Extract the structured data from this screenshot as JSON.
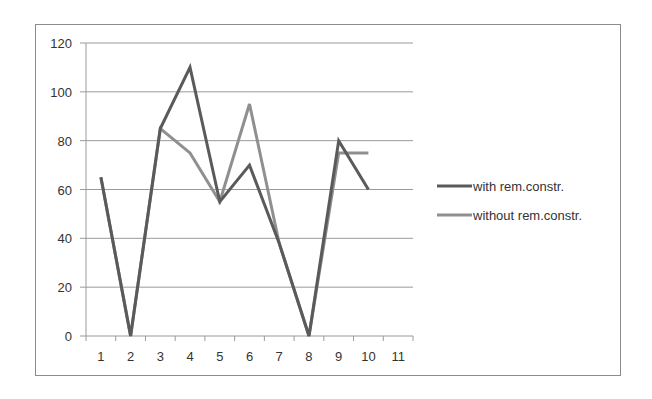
{
  "chart_data": {
    "type": "line",
    "title": "",
    "xlabel": "",
    "ylabel": "",
    "categories": [
      "1",
      "2",
      "3",
      "4",
      "5",
      "6",
      "7",
      "8",
      "9",
      "10",
      "11"
    ],
    "series": [
      {
        "name": "with rem.constr.",
        "color": "#5a5a5a",
        "values": [
          65,
          0,
          85,
          110,
          55,
          70,
          38,
          0,
          80,
          60,
          null
        ]
      },
      {
        "name": "without rem.constr.",
        "color": "#8f8f8f",
        "values": [
          65,
          0,
          85,
          75,
          55,
          95,
          38,
          0,
          75,
          75,
          null
        ]
      }
    ],
    "ylim": [
      0,
      120
    ],
    "yticks": [
      0,
      20,
      40,
      60,
      80,
      100,
      120
    ],
    "grid": true,
    "legend_position": "right"
  },
  "legend": {
    "items": [
      {
        "label": "with rem.constr."
      },
      {
        "label": "without rem.constr."
      }
    ]
  }
}
